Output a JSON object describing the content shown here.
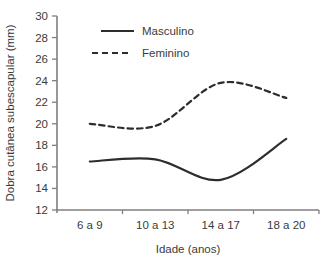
{
  "chart_data": {
    "type": "line",
    "title": "",
    "xlabel": "Idade (anos)",
    "ylabel": "Dobra cutânea subescapular (mm)",
    "categories": [
      "6 a 9",
      "10 a 13",
      "14 a 17",
      "18 a 20"
    ],
    "series": [
      {
        "name": "Masculino",
        "style": "solid",
        "values": [
          16.5,
          16.7,
          14.8,
          18.6
        ]
      },
      {
        "name": "Feminino",
        "style": "dashed",
        "values": [
          20.0,
          19.8,
          23.8,
          22.4
        ]
      }
    ],
    "ylim": [
      12,
      30
    ],
    "yticks": [
      12,
      14,
      16,
      18,
      20,
      22,
      24,
      26,
      28,
      30
    ],
    "grid": false,
    "legend_position": "top-left-inside",
    "colors": {
      "line": "#2d2d2d",
      "axis": "#7f7f7f",
      "text": "#3b3b3b",
      "background": "#ffffff"
    }
  }
}
